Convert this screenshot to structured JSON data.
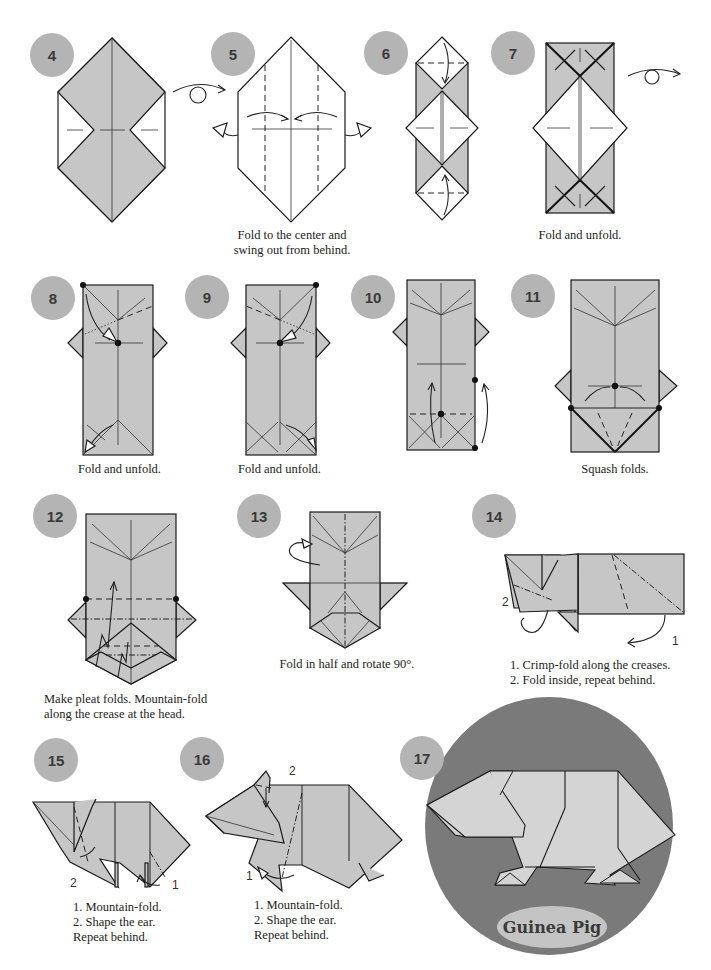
{
  "page": {
    "colors": {
      "paper": "#c6c6c6",
      "badge": "#b4b4b4",
      "final_circle": "#7a7a7a",
      "title_oval": "#c4c4c4",
      "line": "#1a1a1a"
    }
  },
  "steps": [
    {
      "number": "4",
      "caption": ""
    },
    {
      "number": "5",
      "caption": "Fold to the center and\nswing out from behind."
    },
    {
      "number": "6",
      "caption": ""
    },
    {
      "number": "7",
      "caption": "Fold and unfold."
    },
    {
      "number": "8",
      "caption": "Fold and unfold."
    },
    {
      "number": "9",
      "caption": "Fold and unfold."
    },
    {
      "number": "10",
      "caption": ""
    },
    {
      "number": "11",
      "caption": "Squash folds."
    },
    {
      "number": "12",
      "caption": "Make pleat folds. Mountain-fold\nalong the crease at the head."
    },
    {
      "number": "13",
      "caption": "Fold in half and rotate 90°."
    },
    {
      "number": "14",
      "caption": "1. Crimp-fold along the creases.\n2. Fold inside, repeat behind."
    },
    {
      "number": "15",
      "caption": "Crimp folds,\nrepeat behind."
    },
    {
      "number": "16",
      "caption": "1. Mountain-fold.\n2. Shape the ear.\nRepeat behind."
    },
    {
      "number": "17",
      "caption": ""
    }
  ],
  "annotations": {
    "step14_labels": [
      "1",
      "2"
    ],
    "step15_labels": [
      "1",
      "2"
    ],
    "step16_labels": [
      "1",
      "2"
    ]
  },
  "final": {
    "title": "Guinea Pig"
  }
}
